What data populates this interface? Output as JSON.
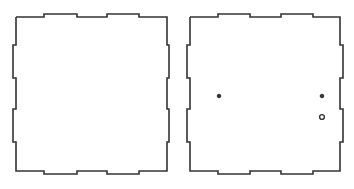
{
  "diagram": {
    "type": "laser-cut box panels",
    "stroke_color": "#333333",
    "background": "#ffffff",
    "panels": [
      {
        "id": "panel-left",
        "offset_x": 0,
        "outline_points": "16,17 44,17 44,14 77,14 77,17 107,17 107,14 139,14 139,17 167,17 167,45 169,45 169,78 167,78 167,109 169,109 169,142 167,142 167,171 139,171 139,174 107,174 107,171 77,171 77,174 44,174 44,171 16,171 16,142 13,142 13,109 16,109 16,78 13,78 13,45 16,45 16,17",
        "holes": []
      },
      {
        "id": "panel-right",
        "offset_x": 0,
        "outline_points": "190,17 218,17 218,14 250,14 250,17 281,17 281,14 313,14 313,17 340,17 340,45 343,45 343,78 340,78 340,109 343,109 343,142 340,142 340,171 313,171 313,174 281,174 281,171 250,171 250,174 218,174 218,171 190,171 190,142 187,142 187,109 190,109 190,78 187,78 187,45 190,45 190,17",
        "holes": [
          {
            "kind": "filled",
            "cx": 219,
            "cy": 96,
            "r": 1.8
          },
          {
            "kind": "filled",
            "cx": 322,
            "cy": 96,
            "r": 1.8
          },
          {
            "kind": "open",
            "cx": 322,
            "cy": 117,
            "r": 2.4
          }
        ]
      }
    ]
  }
}
